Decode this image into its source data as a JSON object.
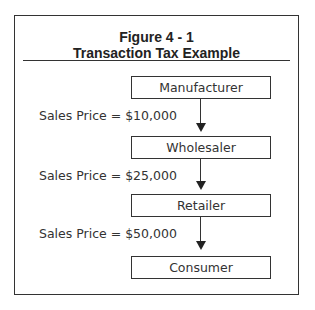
{
  "figure": {
    "number": "Figure 4 - 1",
    "title": "Transaction Tax Example"
  },
  "nodes": [
    {
      "label": "Manufacturer"
    },
    {
      "label": "Wholesaler"
    },
    {
      "label": "Retailer"
    },
    {
      "label": "Consumer"
    }
  ],
  "edges": [
    {
      "from": "Manufacturer",
      "to": "Wholesaler",
      "label": "Sales Price = $10,000"
    },
    {
      "from": "Wholesaler",
      "to": "Retailer",
      "label": "Sales Price = $25,000"
    },
    {
      "from": "Retailer",
      "to": "Consumer",
      "label": "Sales Price = $50,000"
    }
  ],
  "colors": {
    "line": "#333333",
    "background": "#ffffff"
  }
}
